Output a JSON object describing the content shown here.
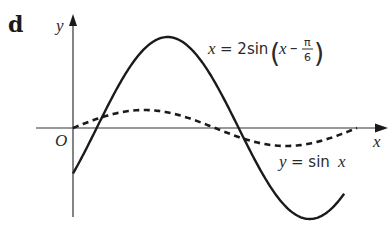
{
  "figure": {
    "part_label": "d",
    "axes": {
      "y_label": "y",
      "x_label": "x",
      "origin_label": "O"
    },
    "curves": [
      {
        "name": "solid",
        "label_prefix": "y = 2sin",
        "label_var": "x",
        "label_minus": "–",
        "label_frac_num": "π",
        "label_frac_den": "6",
        "equation": "y = 2sin(x − π/6)",
        "style": "solid",
        "color": "#1a1a1a"
      },
      {
        "name": "dashed",
        "label_prefix": "y = sin",
        "label_var": "x",
        "equation": "y = sin x",
        "style": "dashed",
        "color": "#1a1a1a"
      }
    ]
  },
  "chart_data": {
    "type": "line",
    "title": "",
    "xlabel": "x",
    "ylabel": "y",
    "grid": false,
    "series": [
      {
        "name": "y = 2sin(x − π/6)",
        "function": "2*sin(x - pi/6)",
        "style": "solid",
        "x_range": [
          0,
          6.0
        ]
      },
      {
        "name": "y = sin x",
        "function": "sin(x)",
        "style": "dashed",
        "x_range": [
          0,
          6.283
        ]
      }
    ],
    "annotations": [
      "d",
      "O",
      "y = 2sin(x − π/6)",
      "y = sin x"
    ]
  }
}
